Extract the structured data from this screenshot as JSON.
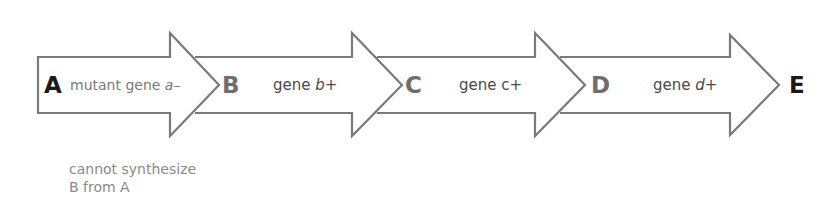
{
  "diagram": {
    "type": "metabolic-pathway",
    "colors": {
      "outline": "#7a7a7a",
      "node_dark": "#1a1a1a",
      "node_gray": "#6e6e6e",
      "gene_text": "#4a4a4a",
      "mutant_text": "#7a7a7a",
      "note_text": "#8a8a8a"
    },
    "nodes": [
      {
        "id": "A",
        "label": "A"
      },
      {
        "id": "B",
        "label": "B"
      },
      {
        "id": "C",
        "label": "C"
      },
      {
        "id": "D",
        "label": "D"
      },
      {
        "id": "E",
        "label": "E"
      }
    ],
    "steps": [
      {
        "from": "A",
        "to": "B",
        "prefix": "mutant gene ",
        "gene": "a",
        "suffix": "–",
        "mutant": true
      },
      {
        "from": "B",
        "to": "C",
        "prefix": "gene ",
        "gene": "b",
        "suffix": "+",
        "mutant": false
      },
      {
        "from": "C",
        "to": "D",
        "prefix": "gene ",
        "gene": "c",
        "suffix": "+",
        "mutant": false
      },
      {
        "from": "D",
        "to": "E",
        "prefix": "gene ",
        "gene": "d",
        "suffix": "+",
        "mutant": false
      }
    ],
    "note": {
      "line1": "cannot synthesize",
      "line2": "B from A"
    }
  }
}
